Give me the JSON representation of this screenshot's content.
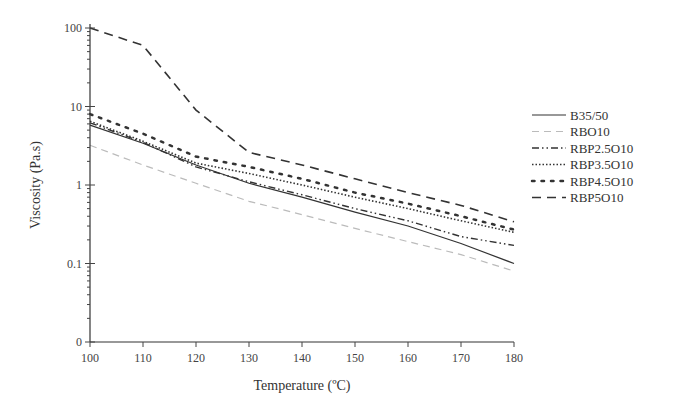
{
  "chart_data": {
    "type": "line",
    "title": "",
    "xlabel": "Temperature (ºC)",
    "ylabel": "Viscosity (Pa.s)",
    "yscale": "log",
    "xlim": [
      100,
      180
    ],
    "ylim": [
      0.01,
      100
    ],
    "x_ticks": [
      100,
      110,
      120,
      130,
      140,
      150,
      160,
      170,
      180
    ],
    "x_tick_labels": [
      "100",
      "110",
      "120",
      "130",
      "140",
      "150",
      "160",
      "170",
      "180"
    ],
    "y_ticks": [
      0.01,
      0.1,
      1,
      10,
      100
    ],
    "y_tick_labels": [
      "0",
      "0.1",
      "1",
      "10",
      "100"
    ],
    "grid": false,
    "legend_position": "right",
    "x": [
      100,
      110,
      120,
      130,
      140,
      150,
      160,
      170,
      180
    ],
    "series": [
      {
        "name": "B35/50",
        "style": "solid",
        "color": "#333333",
        "values": [
          5.8,
          3.4,
          1.8,
          1.05,
          0.7,
          0.45,
          0.3,
          0.18,
          0.1
        ]
      },
      {
        "name": "RBO10",
        "style": "light-dashed",
        "color": "#bbbbbb",
        "values": [
          3.2,
          1.8,
          1.05,
          0.62,
          0.42,
          0.28,
          0.19,
          0.13,
          0.08
        ]
      },
      {
        "name": "RBP2.5O10",
        "style": "dash-dot-dot",
        "color": "#333333",
        "values": [
          6.2,
          3.5,
          1.7,
          1.1,
          0.75,
          0.5,
          0.35,
          0.22,
          0.17
        ]
      },
      {
        "name": "RBP3.5O10",
        "style": "dotted",
        "color": "#333333",
        "values": [
          6.5,
          3.6,
          1.9,
          1.4,
          1.0,
          0.7,
          0.5,
          0.35,
          0.25
        ]
      },
      {
        "name": "RBP4.5O10",
        "style": "sparse-dots",
        "color": "#333333",
        "values": [
          8,
          4.5,
          2.3,
          1.7,
          1.2,
          0.8,
          0.58,
          0.4,
          0.27
        ]
      },
      {
        "name": "RBP5O10",
        "style": "dashed",
        "color": "#333333",
        "values": [
          100,
          60,
          9,
          2.6,
          1.8,
          1.2,
          0.8,
          0.55,
          0.34
        ]
      }
    ]
  }
}
